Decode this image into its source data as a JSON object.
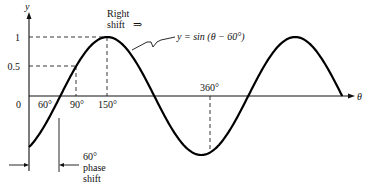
{
  "figure": {
    "y_axis_label": "y",
    "x_axis_label": "θ",
    "equation_label": "y = sin (θ − 60°)",
    "right_shift_line1": "Right",
    "right_shift_line2": "shift",
    "right_shift_arrow": "⇒",
    "phase_shift_line1": "60°",
    "phase_shift_line2": "phase",
    "phase_shift_line3": "shift",
    "origin_label": "0",
    "y_ticks": [
      {
        "value": 1,
        "label": "1"
      },
      {
        "value": 0.5,
        "label": "0.5"
      }
    ],
    "x_ticks": [
      {
        "value": 60,
        "label": "60°"
      },
      {
        "value": 90,
        "label": "90°"
      },
      {
        "value": 150,
        "label": "150°"
      },
      {
        "value": 360,
        "label": "360°"
      }
    ]
  },
  "chart_data": {
    "type": "line",
    "title": "",
    "xlabel": "θ",
    "ylabel": "y",
    "series": [
      {
        "name": "y = sin(θ − 60°)",
        "function": "sin(theta - 60deg)",
        "x_range_deg": [
          0,
          600
        ]
      }
    ],
    "x": [
      0,
      60,
      90,
      150,
      240,
      330,
      420,
      510,
      600
    ],
    "values": [
      -0.866,
      0,
      0.5,
      1,
      0,
      -1,
      0,
      1,
      0
    ],
    "annotations": [
      "dashed guide: y=1 at θ=150°",
      "dashed guide: y=0.5 at θ=90°",
      "dashed guide at θ=360° to trough",
      "Right shift ⇒",
      "60° phase shift between θ=0 and θ=60°"
    ],
    "ylim": [
      -1,
      1
    ],
    "grid": false,
    "legend": "none"
  }
}
